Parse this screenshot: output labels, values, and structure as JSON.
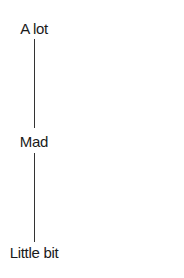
{
  "scale": {
    "top_label": "A lot",
    "middle_label": "Mad",
    "bottom_label": "Little bit"
  },
  "colors": {
    "text": "#1a1a1a",
    "line": "#333333",
    "background": "#ffffff"
  }
}
